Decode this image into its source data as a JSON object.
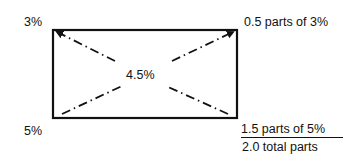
{
  "diagram": {
    "type": "pearson-square",
    "corners": {
      "top_left": "3%",
      "bottom_left": "5%"
    },
    "center": "4.5%",
    "right_labels": {
      "top": "0.5 parts of 3%",
      "bottom_numerator": "1.5 parts of 5%",
      "bottom_denominator": "2.0 total parts"
    },
    "colors": {
      "line": "#111111",
      "background": "#ffffff"
    }
  }
}
